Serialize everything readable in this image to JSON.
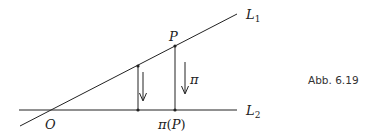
{
  "figure": {
    "caption": "Abb. 6.19",
    "lines": {
      "l1": {
        "label": "L",
        "sub": "1"
      },
      "l2": {
        "label": "L",
        "sub": "2"
      }
    },
    "points": {
      "origin": {
        "label": "O"
      },
      "p": {
        "label": "P"
      },
      "projection": {
        "label_fn": "π",
        "label_open": "(",
        "label_arg": "P",
        "label_close": ")"
      }
    },
    "map_label": "π",
    "colors": {
      "stroke": "#222222",
      "text": "#222222",
      "background": "#ffffff"
    }
  }
}
